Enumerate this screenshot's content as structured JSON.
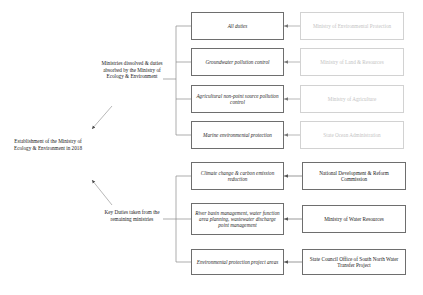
{
  "diagram": {
    "root_label": "Establishment of the Ministry of Ecology & Environment in 2018",
    "branches": [
      {
        "label": "Ministries dissolved & duties absorbed by the Ministry of Ecology & Environment",
        "pairs": [
          {
            "duty": "All duties",
            "ministry": "Ministry of Environmental Protection",
            "style": "faded"
          },
          {
            "duty": "Groundwater pollution control",
            "ministry": "Ministry of Land & Resources",
            "style": "faded"
          },
          {
            "duty": "Agricultural non-point source pollution control",
            "ministry": "Ministry of Agriculture",
            "style": "faded"
          },
          {
            "duty": "Marine environmental protection",
            "ministry": "State Ocean Administration",
            "style": "faded"
          }
        ]
      },
      {
        "label": "Key Duties taken from the remaining ministries",
        "pairs": [
          {
            "duty": "Climate change & carbon emission reduction",
            "ministry": "National Development & Reform Commission",
            "style": "solid"
          },
          {
            "duty": "River basin management, water function area planning, wastewater discharge point management",
            "ministry": "Ministry of Water Resources",
            "style": "solid"
          },
          {
            "duty": "Environmental protection project areas",
            "ministry": "State Council Office of South North Water Transfer Project",
            "style": "solid"
          }
        ]
      }
    ],
    "colors": {
      "border_solid": "#6e6e6e",
      "border_faded": "#d2d2d2",
      "text_solid": "#1a1a1a",
      "text_faded": "#c4c4c4",
      "connector": "#8a8a8a",
      "background": "#ffffff"
    }
  }
}
